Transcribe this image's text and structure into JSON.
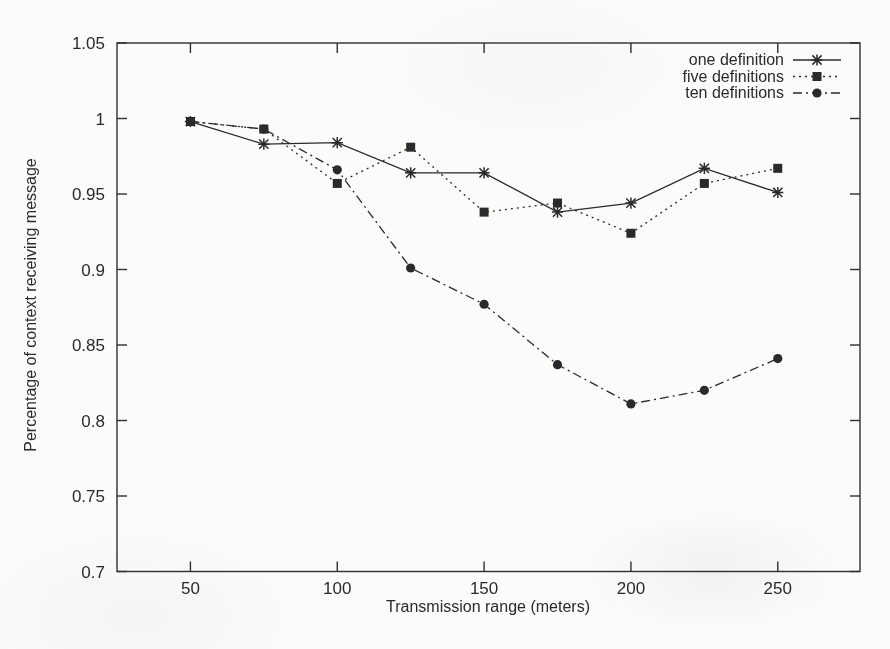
{
  "chart_data": {
    "type": "line",
    "title": "",
    "xlabel": "Transmission range (meters)",
    "ylabel": "Percentage of context receiving message",
    "xlim": [
      25,
      278
    ],
    "ylim": [
      0.7,
      1.05
    ],
    "xticks": [
      50,
      100,
      150,
      200,
      250
    ],
    "xtick_labels": [
      "50",
      "100",
      "150",
      "200",
      "250"
    ],
    "yticks": [
      0.7,
      0.75,
      0.8,
      0.85,
      0.9,
      0.95,
      1.0,
      1.05
    ],
    "ytick_labels": [
      "0.7",
      "0.75",
      "0.8",
      "0.85",
      "0.9",
      "0.95",
      "1",
      "1.05"
    ],
    "grid": false,
    "legend_position": "top-right",
    "x": [
      50,
      75,
      100,
      125,
      150,
      175,
      200,
      225,
      250
    ],
    "series": [
      {
        "name": "one definition",
        "marker": "star",
        "line_style": "solid",
        "color": "#2a2a2a",
        "values": [
          0.998,
          0.983,
          0.984,
          0.964,
          0.964,
          0.938,
          0.944,
          0.967,
          0.951
        ]
      },
      {
        "name": "five definitions",
        "marker": "square",
        "line_style": "dotted",
        "color": "#2a2a2a",
        "values": [
          0.998,
          0.993,
          0.957,
          0.981,
          0.938,
          0.944,
          0.924,
          0.957,
          0.967
        ]
      },
      {
        "name": "ten definitions",
        "marker": "circle",
        "line_style": "dashdot",
        "color": "#2a2a2a",
        "values": [
          0.998,
          0.993,
          0.966,
          0.901,
          0.877,
          0.837,
          0.811,
          0.82,
          0.841
        ]
      }
    ],
    "colors": {
      "axis": "#2f2f2f",
      "text": "#2a2a2a",
      "background": "#fbfbf9"
    }
  }
}
